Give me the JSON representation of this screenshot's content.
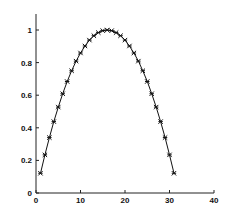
{
  "chart_data": {
    "type": "line",
    "title": "",
    "xlabel": "",
    "ylabel": "",
    "xlim": [
      0,
      40
    ],
    "ylim": [
      0,
      1.05
    ],
    "grid": false,
    "legend": null,
    "x_ticks": [
      0,
      10,
      20,
      30,
      40
    ],
    "x_tick_labels": [
      "0",
      "10",
      "20",
      "30",
      "40"
    ],
    "y_ticks": [
      0,
      0.2,
      0.4,
      0.6,
      0.8,
      1
    ],
    "y_tick_labels": [
      "0",
      "0.2",
      "0.4",
      "0.6",
      "0.8",
      "1"
    ],
    "series": [
      {
        "name": "",
        "color": "#111111",
        "marker": "asterisk",
        "x": [
          1,
          2,
          3,
          4,
          5,
          6,
          7,
          8,
          9,
          10,
          11,
          12,
          13,
          14,
          15,
          16,
          17,
          18,
          19,
          20,
          21,
          22,
          23,
          24,
          25,
          26,
          27,
          28,
          29,
          30,
          31
        ],
        "y": [
          0.121,
          0.234,
          0.34,
          0.438,
          0.527,
          0.609,
          0.684,
          0.75,
          0.809,
          0.859,
          0.902,
          0.938,
          0.965,
          0.984,
          0.996,
          1.0,
          0.996,
          0.984,
          0.965,
          0.938,
          0.902,
          0.859,
          0.809,
          0.75,
          0.684,
          0.609,
          0.527,
          0.438,
          0.34,
          0.234,
          0.121
        ]
      }
    ]
  }
}
